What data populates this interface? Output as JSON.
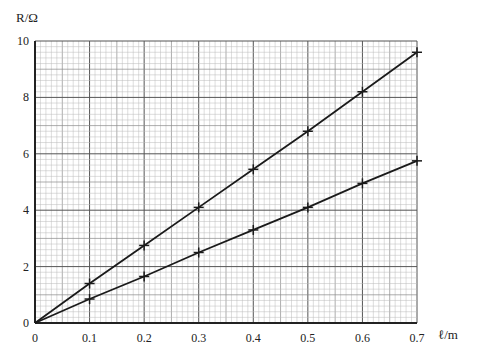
{
  "chart_data": {
    "type": "line",
    "title": "",
    "xlabel": "ℓ/m",
    "ylabel": "R/Ω",
    "xlim": [
      0,
      0.7
    ],
    "ylim": [
      0,
      10
    ],
    "x_ticks": [
      "0",
      "0.1",
      "0.2",
      "0.3",
      "0.4",
      "0.5",
      "0.6",
      "0.7"
    ],
    "y_ticks": [
      "0",
      "2",
      "4",
      "6",
      "8",
      "10"
    ],
    "grid": true,
    "legend": null,
    "x": [
      0,
      0.1,
      0.2,
      0.3,
      0.4,
      0.5,
      0.6,
      0.7
    ],
    "series": [
      {
        "name": "upper line",
        "values": [
          0,
          1.4,
          2.75,
          4.1,
          5.45,
          6.8,
          8.2,
          9.6
        ],
        "marker": "+"
      },
      {
        "name": "lower line",
        "values": [
          0,
          0.85,
          1.65,
          2.5,
          3.3,
          4.1,
          4.95,
          5.75
        ],
        "marker": "+"
      }
    ]
  },
  "labels": {
    "y_axis": "R/Ω",
    "x_axis": "ℓ/m",
    "origin": "0"
  },
  "colors": {
    "line": "#1a1a1a",
    "grid_major": "#555555",
    "grid_minor": "#bbbbbb",
    "grid_mid": "#8a8a8a"
  }
}
